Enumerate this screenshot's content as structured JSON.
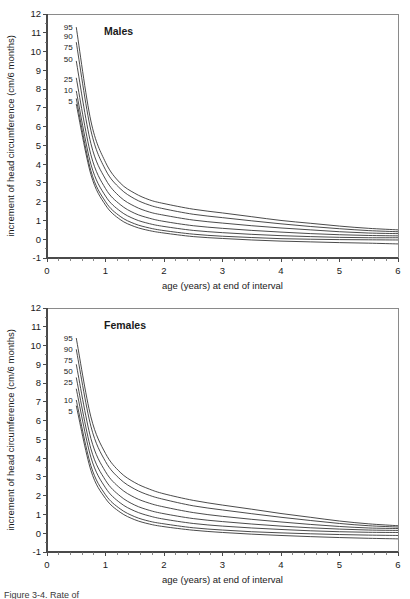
{
  "figure": {
    "caption": "Figure 3-4. Rate of"
  },
  "panels": [
    {
      "key": "males",
      "title": "Males",
      "xlabel": "age (years) at end of interval",
      "ylabel": "increment of head circumference (cm/6 months)"
    },
    {
      "key": "females",
      "title": "Females",
      "xlabel": "age (years) at end of interval",
      "ylabel": "increment of head circumference (cm/6 months)"
    }
  ],
  "axis": {
    "x_ticks": [
      "0",
      "1",
      "2",
      "3",
      "4",
      "5",
      "6"
    ],
    "y_ticks": [
      "-1",
      "0",
      "1",
      "2",
      "3",
      "4",
      "5",
      "6",
      "7",
      "8",
      "9",
      "10",
      "11",
      "12"
    ]
  },
  "chart_data": [
    {
      "type": "line",
      "title": "Males",
      "xlabel": "age (years) at end of interval",
      "ylabel": "increment of head circumference (cm/6 months)",
      "xlim": [
        0,
        6
      ],
      "ylim": [
        -1,
        12
      ],
      "xticks": [
        0,
        1,
        2,
        3,
        4,
        5,
        6
      ],
      "yticks": [
        -1,
        0,
        1,
        2,
        3,
        4,
        5,
        6,
        7,
        8,
        9,
        10,
        11,
        12
      ],
      "grid": false,
      "legend": "inline-labels-at-curve-start",
      "x": [
        0.5,
        0.75,
        1.0,
        1.25,
        1.5,
        1.75,
        2.0,
        2.5,
        3.0,
        3.5,
        4.0,
        4.5,
        5.0,
        5.5,
        6.0
      ],
      "series": [
        {
          "name": "95",
          "label": "95",
          "values": [
            11.3,
            6.3,
            4.1,
            3.0,
            2.45,
            2.1,
            1.9,
            1.6,
            1.4,
            1.2,
            1.0,
            0.85,
            0.7,
            0.58,
            0.5
          ]
        },
        {
          "name": "90",
          "label": "90",
          "values": [
            10.5,
            5.8,
            3.7,
            2.7,
            2.15,
            1.82,
            1.62,
            1.33,
            1.15,
            0.98,
            0.82,
            0.68,
            0.56,
            0.46,
            0.4
          ]
        },
        {
          "name": "75",
          "label": "75",
          "values": [
            9.5,
            5.1,
            3.2,
            2.25,
            1.75,
            1.45,
            1.28,
            1.02,
            0.86,
            0.72,
            0.6,
            0.5,
            0.4,
            0.33,
            0.3
          ]
        },
        {
          "name": "50",
          "label": "50",
          "values": [
            8.6,
            4.5,
            2.7,
            1.85,
            1.38,
            1.12,
            0.95,
            0.72,
            0.58,
            0.47,
            0.38,
            0.3,
            0.24,
            0.2,
            0.18
          ]
        },
        {
          "name": "25",
          "label": "25",
          "values": [
            7.9,
            4.0,
            2.3,
            1.5,
            1.07,
            0.83,
            0.68,
            0.47,
            0.35,
            0.26,
            0.19,
            0.14,
            0.1,
            0.08,
            0.08
          ]
        },
        {
          "name": "10",
          "label": "10",
          "values": [
            7.5,
            3.65,
            2.0,
            1.22,
            0.82,
            0.6,
            0.46,
            0.27,
            0.16,
            0.09,
            0.03,
            0.0,
            -0.02,
            -0.03,
            -0.04
          ]
        },
        {
          "name": "5",
          "label": "5",
          "values": [
            7.2,
            3.45,
            1.82,
            1.05,
            0.67,
            0.46,
            0.33,
            0.14,
            0.04,
            -0.04,
            -0.1,
            -0.14,
            -0.18,
            -0.21,
            -0.25
          ]
        }
      ]
    },
    {
      "type": "line",
      "title": "Females",
      "xlabel": "age (years) at end of interval",
      "ylabel": "increment of head circumference (cm/6 months)",
      "xlim": [
        0,
        6
      ],
      "ylim": [
        -1,
        12
      ],
      "xticks": [
        0,
        1,
        2,
        3,
        4,
        5,
        6
      ],
      "yticks": [
        -1,
        0,
        1,
        2,
        3,
        4,
        5,
        6,
        7,
        8,
        9,
        10,
        11,
        12
      ],
      "grid": false,
      "legend": "inline-labels-at-curve-start",
      "x": [
        0.5,
        0.75,
        1.0,
        1.25,
        1.5,
        1.75,
        2.0,
        2.5,
        3.0,
        3.5,
        4.0,
        4.5,
        5.0,
        5.5,
        6.0
      ],
      "series": [
        {
          "name": "95",
          "label": "95",
          "values": [
            10.4,
            6.2,
            4.25,
            3.25,
            2.7,
            2.35,
            2.1,
            1.75,
            1.5,
            1.28,
            1.05,
            0.85,
            0.65,
            0.5,
            0.4
          ]
        },
        {
          "name": "90",
          "label": "90",
          "values": [
            9.8,
            5.7,
            3.82,
            2.88,
            2.35,
            2.02,
            1.8,
            1.46,
            1.24,
            1.04,
            0.85,
            0.68,
            0.52,
            0.4,
            0.33
          ]
        },
        {
          "name": "75",
          "label": "75",
          "values": [
            9.0,
            5.05,
            3.28,
            2.4,
            1.9,
            1.6,
            1.4,
            1.1,
            0.9,
            0.74,
            0.6,
            0.47,
            0.36,
            0.28,
            0.25
          ]
        },
        {
          "name": "50",
          "label": "50",
          "values": [
            8.3,
            4.5,
            2.82,
            1.98,
            1.5,
            1.22,
            1.04,
            0.78,
            0.62,
            0.49,
            0.38,
            0.29,
            0.22,
            0.17,
            0.15
          ]
        },
        {
          "name": "25",
          "label": "25",
          "values": [
            7.7,
            4.05,
            2.42,
            1.62,
            1.18,
            0.92,
            0.75,
            0.52,
            0.38,
            0.28,
            0.2,
            0.13,
            0.08,
            0.05,
            0.04
          ]
        },
        {
          "name": "10",
          "label": "10",
          "values": [
            7.1,
            3.6,
            2.05,
            1.3,
            0.88,
            0.64,
            0.5,
            0.29,
            0.17,
            0.08,
            0.02,
            -0.03,
            -0.07,
            -0.1,
            -0.12
          ]
        },
        {
          "name": "5",
          "label": "5",
          "values": [
            6.8,
            3.35,
            1.85,
            1.12,
            0.72,
            0.49,
            0.35,
            0.16,
            0.04,
            -0.05,
            -0.12,
            -0.18,
            -0.23,
            -0.27,
            -0.3
          ]
        }
      ]
    }
  ]
}
